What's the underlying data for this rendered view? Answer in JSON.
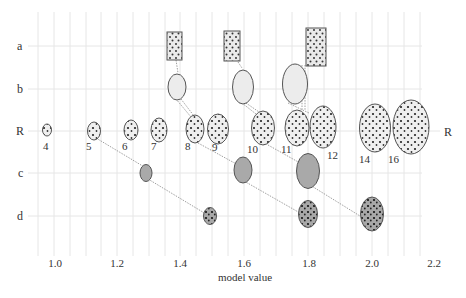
{
  "figure": {
    "xlabel": "model value",
    "x_ticks": [
      "1.0",
      "1.2",
      "1.4",
      "1.6",
      "1.8",
      "2.0",
      "2.2"
    ],
    "x_tick_values": [
      1.0,
      1.2,
      1.4,
      1.6,
      1.8,
      2.0,
      2.2
    ],
    "row_labels_left": [
      "a",
      "b",
      "R",
      "c",
      "d"
    ],
    "row_label_right": "R",
    "reference_row": {
      "label": "R",
      "items": [
        {
          "n": "4",
          "x": 1.0
        },
        {
          "n": "5",
          "x": 1.12
        },
        {
          "n": "6",
          "x": 1.23
        },
        {
          "n": "7",
          "x": 1.32
        },
        {
          "n": "8",
          "x": 1.43
        },
        {
          "n": "9",
          "x": 1.51
        },
        {
          "n": "10",
          "x": 1.64
        },
        {
          "n": "11",
          "x": 1.76
        },
        {
          "n": "12",
          "x": 1.84
        },
        {
          "n": "14",
          "x": 2.0
        },
        {
          "n": "16",
          "x": 2.15
        }
      ]
    },
    "rows": {
      "a": [
        {
          "x": 1.4,
          "shape": "rectangle",
          "links_to": "8"
        },
        {
          "x": 1.59,
          "shape": "rectangle",
          "links_to": "10"
        },
        {
          "x": 1.83,
          "shape": "rectangle",
          "links_to": "12"
        }
      ],
      "b": [
        {
          "x": 1.4,
          "shape": "oval",
          "links_to": "8"
        },
        {
          "x": 1.61,
          "shape": "oval",
          "links_to": "10"
        },
        {
          "x": 1.78,
          "shape": "oval",
          "links_to": "12"
        }
      ],
      "c": [
        {
          "x": 1.3,
          "shape": "oval-filled",
          "links_from": "5"
        },
        {
          "x": 1.6,
          "shape": "oval-filled",
          "links_from": "9"
        },
        {
          "x": 1.8,
          "shape": "oval-filled",
          "links_from": "11"
        }
      ],
      "d": [
        {
          "x": 1.5,
          "shape": "oval-dotted",
          "links_from": "c@1.3"
        },
        {
          "x": 1.8,
          "shape": "oval-dotted",
          "links_from": "c@1.6"
        },
        {
          "x": 2.0,
          "shape": "oval-dotted",
          "links_from": "c@1.8"
        }
      ]
    },
    "colors": {
      "grid": "#e4e4e4",
      "outline": "#555555",
      "light_fill": "#eeeeee",
      "dark_fill": "#aaaaaa",
      "dot": "#222222",
      "link": "#888888"
    }
  }
}
